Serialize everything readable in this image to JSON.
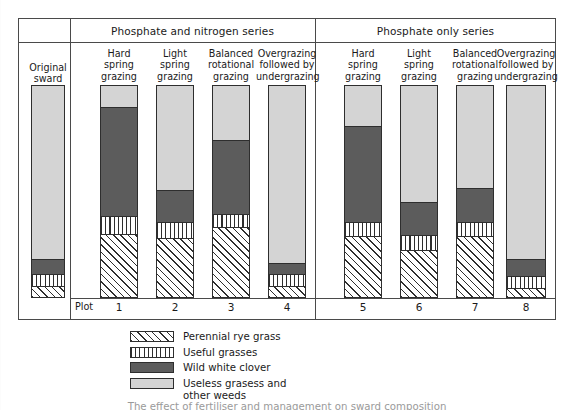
{
  "figure": {
    "caption": "The effect of fertiliser and management on sward composition"
  },
  "header": {
    "series": [
      {
        "label": "Phosphate and nitrogen series"
      },
      {
        "label": "Phosphate only series"
      }
    ]
  },
  "original": {
    "label": "Original\nsward"
  },
  "plot_row": {
    "label": "Plot"
  },
  "legend": {
    "items": [
      {
        "pattern": "diagonal-hatch",
        "label": "Perennial rye grass"
      },
      {
        "pattern": "vertical-stripes",
        "label": "Useful grasses"
      },
      {
        "pattern": "solid-dark-grey",
        "label": "Wild white clover"
      },
      {
        "pattern": "solid-light-grey",
        "label": "Useless grasess and\nother weeds"
      }
    ]
  },
  "colors": {
    "useless_grasses": "#d4d4d4",
    "wild_white_clover": "#5c5c5c",
    "useful_grasses": "#ffffff",
    "perennial_rye_grass": "#ffffff",
    "outline": "#2e2e2e",
    "frame": "#4a4a4a"
  },
  "chart_data": {
    "type": "bar",
    "stacked": true,
    "ylabel": "",
    "xlabel": "",
    "ylim": [
      0,
      100
    ],
    "grid": false,
    "legend_position": "bottom",
    "categories": [
      "Original sward",
      "Hard spring grazing",
      "Light spring grazing",
      "Balanced rotational grazing",
      "Overgrazing followed by undergrazing",
      "Hard spring grazing",
      "Light spring grazing",
      "Balanced rotational grazing",
      "Overgrazing followed by undergrazing"
    ],
    "plot_numbers": [
      "",
      "1",
      "2",
      "3",
      "4",
      "5",
      "6",
      "7",
      "8"
    ],
    "groups": [
      "Original sward",
      "Phosphate and nitrogen series",
      "Phosphate and nitrogen series",
      "Phosphate and nitrogen series",
      "Phosphate and nitrogen series",
      "Phosphate only series",
      "Phosphate only series",
      "Phosphate only series",
      "Phosphate only series"
    ],
    "series": [
      {
        "name": "Perennial rye grass",
        "values": [
          5,
          30,
          28,
          33,
          5,
          29,
          22,
          29,
          4
        ]
      },
      {
        "name": "Useful grasses",
        "values": [
          5,
          8,
          7,
          6,
          5,
          6,
          7,
          6,
          5
        ]
      },
      {
        "name": "Wild white clover",
        "values": [
          7,
          52,
          15,
          35,
          5,
          46,
          15,
          16,
          8
        ]
      },
      {
        "name": "Useless grasess and other weeds",
        "values": [
          83,
          10,
          50,
          26,
          85,
          19,
          56,
          49,
          83
        ]
      }
    ]
  },
  "bars": [
    {
      "id": "original-sward",
      "label": "Original\nsward",
      "plot": "",
      "x": 31,
      "width": 34,
      "segments": [
        {
          "name": "useless",
          "pct": 83
        },
        {
          "name": "clover",
          "pct": 7
        },
        {
          "name": "useful",
          "pct": 5
        },
        {
          "name": "rye",
          "pct": 5
        }
      ]
    },
    {
      "id": "plot-1",
      "label": "Hard\nspring\ngrazing",
      "plot": "1",
      "x": 100,
      "width": 38,
      "segments": [
        {
          "name": "useless",
          "pct": 10
        },
        {
          "name": "clover",
          "pct": 52
        },
        {
          "name": "useful",
          "pct": 8
        },
        {
          "name": "rye",
          "pct": 30
        }
      ]
    },
    {
      "id": "plot-2",
      "label": "Light\nspring\ngrazing",
      "plot": "2",
      "x": 156,
      "width": 38,
      "segments": [
        {
          "name": "useless",
          "pct": 50
        },
        {
          "name": "clover",
          "pct": 15
        },
        {
          "name": "useful",
          "pct": 7
        },
        {
          "name": "rye",
          "pct": 28
        }
      ]
    },
    {
      "id": "plot-3",
      "label": "Balanced\nrotational\ngrazing",
      "plot": "3",
      "x": 212,
      "width": 38,
      "segments": [
        {
          "name": "useless",
          "pct": 26
        },
        {
          "name": "clover",
          "pct": 35
        },
        {
          "name": "useful",
          "pct": 6
        },
        {
          "name": "rye",
          "pct": 33
        }
      ]
    },
    {
      "id": "plot-4",
      "label": "Overgrazing\nfollowed by\nundergrazing",
      "plot": "4",
      "x": 268,
      "width": 38,
      "segments": [
        {
          "name": "useless",
          "pct": 85
        },
        {
          "name": "clover",
          "pct": 5
        },
        {
          "name": "useful",
          "pct": 5
        },
        {
          "name": "rye",
          "pct": 5
        }
      ]
    },
    {
      "id": "plot-5",
      "label": "Hard\nspring\ngrazing",
      "plot": "5",
      "x": 344,
      "width": 38,
      "segments": [
        {
          "name": "useless",
          "pct": 19
        },
        {
          "name": "clover",
          "pct": 46
        },
        {
          "name": "useful",
          "pct": 6
        },
        {
          "name": "rye",
          "pct": 29
        }
      ]
    },
    {
      "id": "plot-6",
      "label": "Light\nspring\ngrazing",
      "plot": "6",
      "x": 400,
      "width": 38,
      "segments": [
        {
          "name": "useless",
          "pct": 56
        },
        {
          "name": "clover",
          "pct": 15
        },
        {
          "name": "useful",
          "pct": 7
        },
        {
          "name": "rye",
          "pct": 22
        }
      ]
    },
    {
      "id": "plot-7",
      "label": "Balanced\nrotational\ngrazing",
      "plot": "7",
      "x": 456,
      "width": 38,
      "segments": [
        {
          "name": "useless",
          "pct": 49
        },
        {
          "name": "clover",
          "pct": 16
        },
        {
          "name": "useful",
          "pct": 6
        },
        {
          "name": "rye",
          "pct": 29
        }
      ]
    },
    {
      "id": "plot-8",
      "label": "Overgrazing\nfollowed by\nundergrazing",
      "plot": "8",
      "x": 506,
      "width": 40,
      "segments": [
        {
          "name": "useless",
          "pct": 83
        },
        {
          "name": "clover",
          "pct": 8
        },
        {
          "name": "useful",
          "pct": 5
        },
        {
          "name": "rye",
          "pct": 4
        }
      ]
    }
  ]
}
